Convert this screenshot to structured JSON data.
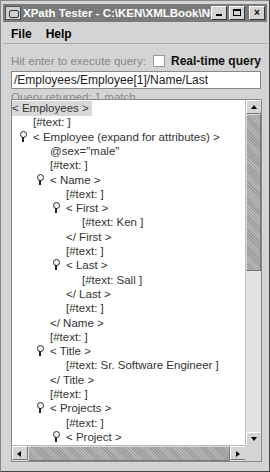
{
  "window": {
    "title": "XPath Tester - C:\\KEN\\XMLBook\\NOTE...",
    "minimize_label": "minimize",
    "maximize_label": "maximize",
    "close_label": "×"
  },
  "menu": {
    "items": [
      {
        "label": "File"
      },
      {
        "label": "Help"
      }
    ]
  },
  "query": {
    "hint": "Hit enter to execute query:",
    "realtime_label": "Real-time query",
    "realtime_checked": false,
    "value": "/Employees/Employee[1]/Name/Last",
    "status": "Query returned: 1 match"
  },
  "tree": {
    "nodes": [
      {
        "text": "< Employees >",
        "indent": 0,
        "handle": false,
        "selected": true
      },
      {
        "text": "[#text:  ]",
        "indent": 1,
        "handle": false
      },
      {
        "text": "< Employee (expand for attributes) >",
        "indent": 1,
        "handle": true
      },
      {
        "text": "@sex=\"male\"",
        "indent": 2,
        "handle": false
      },
      {
        "text": "[#text:  ]",
        "indent": 2,
        "handle": false
      },
      {
        "text": "< Name >",
        "indent": 2,
        "handle": true
      },
      {
        "text": "[#text:  ]",
        "indent": 3,
        "handle": false
      },
      {
        "text": "< First >",
        "indent": 3,
        "handle": true
      },
      {
        "text": "[#text: Ken ]",
        "indent": 4,
        "handle": false
      },
      {
        "text": "</ First >",
        "indent": 3,
        "handle": false
      },
      {
        "text": "[#text:  ]",
        "indent": 3,
        "handle": false
      },
      {
        "text": "< Last >",
        "indent": 3,
        "handle": true
      },
      {
        "text": "[#text: Sall ]",
        "indent": 4,
        "handle": false
      },
      {
        "text": "</ Last >",
        "indent": 3,
        "handle": false
      },
      {
        "text": "[#text:  ]",
        "indent": 3,
        "handle": false
      },
      {
        "text": "</ Name >",
        "indent": 2,
        "handle": false
      },
      {
        "text": "[#text:  ]",
        "indent": 2,
        "handle": false
      },
      {
        "text": "< Title >",
        "indent": 2,
        "handle": true
      },
      {
        "text": "[#text: Sr. Software Engineer ]",
        "indent": 3,
        "handle": false
      },
      {
        "text": "</ Title >",
        "indent": 2,
        "handle": false
      },
      {
        "text": "[#text:  ]",
        "indent": 2,
        "handle": false
      },
      {
        "text": "< Projects >",
        "indent": 2,
        "handle": true
      },
      {
        "text": "[#text:  ]",
        "indent": 3,
        "handle": false
      },
      {
        "text": "< Project >",
        "indent": 3,
        "handle": true
      }
    ]
  }
}
